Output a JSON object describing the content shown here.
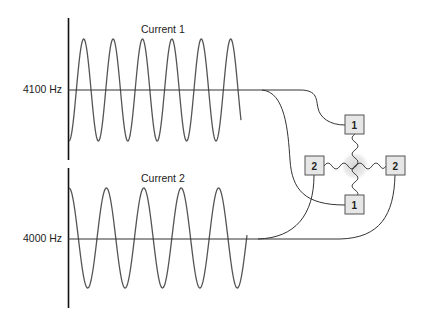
{
  "currents": [
    {
      "label": "Current 1",
      "frequency_label": "4100 Hz",
      "cycles_shown": 6,
      "electrode_label": "1"
    },
    {
      "label": "Current 2",
      "frequency_label": "4000 Hz",
      "cycles_shown": 5,
      "electrode_label": "2"
    }
  ],
  "electrodes": [
    {
      "label": "1",
      "position": "top"
    },
    {
      "label": "2",
      "position": "left"
    },
    {
      "label": "2",
      "position": "right"
    },
    {
      "label": "1",
      "position": "bottom"
    }
  ],
  "colors": {
    "line": "#333333",
    "wave": "#555555",
    "box_fill": "#e6e6e6",
    "box_stroke": "#555555",
    "crossing_glow": "#d8d8d8"
  }
}
